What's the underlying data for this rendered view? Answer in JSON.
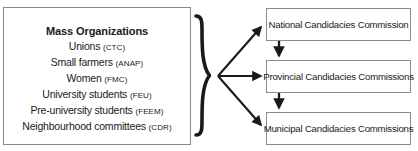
{
  "diagram": {
    "background_color": "#ffffff",
    "line_color": "#1a1a1a",
    "box_border_color": "#8b8b8b",
    "text_color": "#1a1a1a"
  },
  "mass_organizations": {
    "heading": "Mass Organizations",
    "entries": [
      {
        "name": "Unions",
        "abbr": "(CTC)"
      },
      {
        "name": "Small farmers",
        "abbr": "(ANAP)"
      },
      {
        "name": "Women",
        "abbr": "(FMC)"
      },
      {
        "name": "University students",
        "abbr": "(FEU)"
      },
      {
        "name": "Pre-university students",
        "abbr": "(FEEM)"
      },
      {
        "name": "Neighbourhood committees",
        "abbr": "(CDR)"
      }
    ]
  },
  "commissions": [
    {
      "label": "National Candidacies Commission"
    },
    {
      "label": "Provincial Candidacies Commissions"
    },
    {
      "label": "Municipal Candidacies Commissions"
    }
  ],
  "connectors": {
    "brace_icon": "curly-brace-right-icon",
    "fan_arrows": [
      {
        "target": "National Candidacies Commission"
      },
      {
        "target": "Provincial Candidacies Commissions"
      },
      {
        "target": "Municipal Candidacies Commissions"
      }
    ],
    "chain_arrows": [
      {
        "from": "National Candidacies Commission",
        "to": "Provincial Candidacies Commissions"
      },
      {
        "from": "Provincial Candidacies Commissions",
        "to": "Municipal Candidacies Commissions"
      }
    ]
  }
}
